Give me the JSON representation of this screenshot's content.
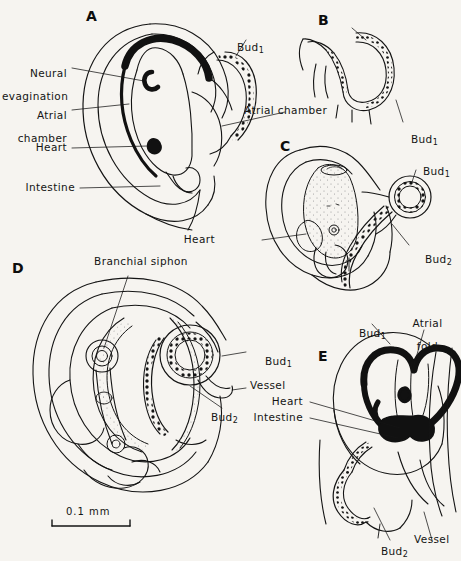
{
  "figure": {
    "type": "scientific-illustration",
    "background_color": "#f6f4f0",
    "ink_color": "#141414",
    "panels": [
      {
        "id": "A",
        "letter": "A",
        "labels": [
          "Neural\nevagination",
          "Atrial\nchamber",
          "Heart",
          "Intestine",
          "Bud1",
          "Atrial chamber"
        ]
      },
      {
        "id": "B",
        "letter": "B",
        "labels": [
          "Bud1"
        ]
      },
      {
        "id": "C",
        "letter": "C",
        "labels": [
          "Bud1",
          "Bud2",
          "Heart"
        ]
      },
      {
        "id": "D",
        "letter": "D",
        "labels": [
          "Branchial siphon",
          "Bud1",
          "Vessel",
          "Bud2"
        ]
      },
      {
        "id": "E",
        "letter": "E",
        "labels": [
          "Bud1",
          "Atrial\nfold",
          "Heart",
          "Intestine",
          "Bud2",
          "Vessel"
        ]
      }
    ],
    "letters": {
      "a": "A",
      "b": "B",
      "c": "C",
      "d": "D",
      "e": "E"
    },
    "labels": {
      "neural_evagination_l1": "Neural",
      "neural_evagination_l2": "evagination",
      "atrial_chamber_l1": "Atrial",
      "atrial_chamber_l2": "chamber",
      "heart": "Heart",
      "intestine": "Intestine",
      "atrial_chamber_full": "Atrial chamber",
      "bud": "Bud",
      "bud_sub_1": "1",
      "bud_sub_2": "2",
      "branchial_siphon": "Branchial siphon",
      "vessel": "Vessel",
      "atrial_fold_l1": "Atrial",
      "atrial_fold_l2": "fold"
    },
    "scale_bar": {
      "text": "0.1 mm",
      "length_px": 78
    }
  }
}
